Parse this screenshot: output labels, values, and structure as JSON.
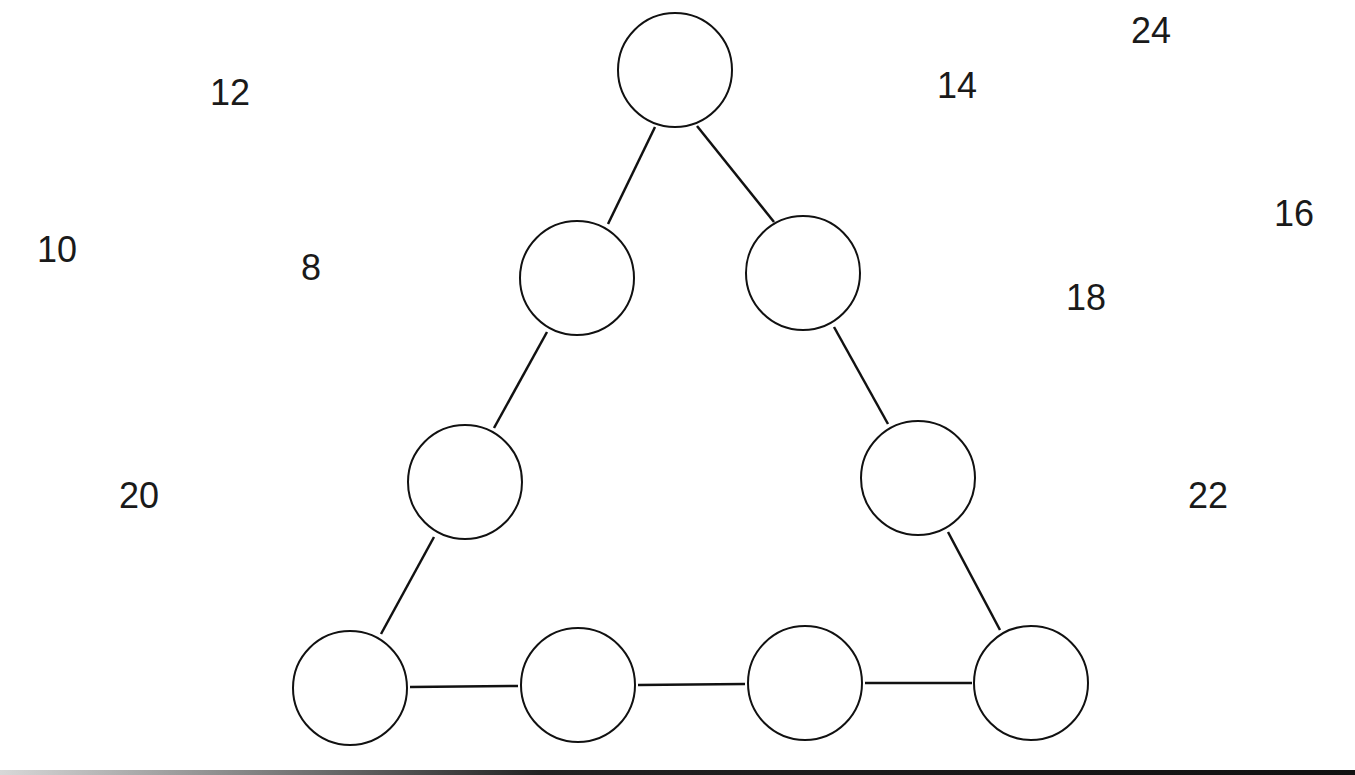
{
  "puzzle": {
    "numbers": [
      {
        "value": "12",
        "x": 210,
        "y": 75
      },
      {
        "value": "10",
        "x": 37,
        "y": 232
      },
      {
        "value": "8",
        "x": 301,
        "y": 250
      },
      {
        "value": "20",
        "x": 119,
        "y": 478
      },
      {
        "value": "24",
        "x": 1131,
        "y": 13
      },
      {
        "value": "14",
        "x": 937,
        "y": 68
      },
      {
        "value": "16",
        "x": 1274,
        "y": 196
      },
      {
        "value": "18",
        "x": 1066,
        "y": 280
      },
      {
        "value": "22",
        "x": 1188,
        "y": 478
      }
    ],
    "circles": [
      {
        "id": "top",
        "cx": 675,
        "cy": 70,
        "value": ""
      },
      {
        "id": "left-2",
        "cx": 577,
        "cy": 278,
        "value": ""
      },
      {
        "id": "right-2",
        "cx": 803,
        "cy": 273,
        "value": ""
      },
      {
        "id": "left-3",
        "cx": 465,
        "cy": 482,
        "value": ""
      },
      {
        "id": "right-3",
        "cx": 918,
        "cy": 478,
        "value": ""
      },
      {
        "id": "bottom-1",
        "cx": 350,
        "cy": 688,
        "value": ""
      },
      {
        "id": "bottom-2",
        "cx": 578,
        "cy": 685,
        "value": ""
      },
      {
        "id": "bottom-3",
        "cx": 805,
        "cy": 683,
        "value": ""
      },
      {
        "id": "bottom-4",
        "cx": 1031,
        "cy": 683,
        "value": ""
      }
    ],
    "stroke_color": "#111111",
    "text_color": "#1a1a1a"
  }
}
